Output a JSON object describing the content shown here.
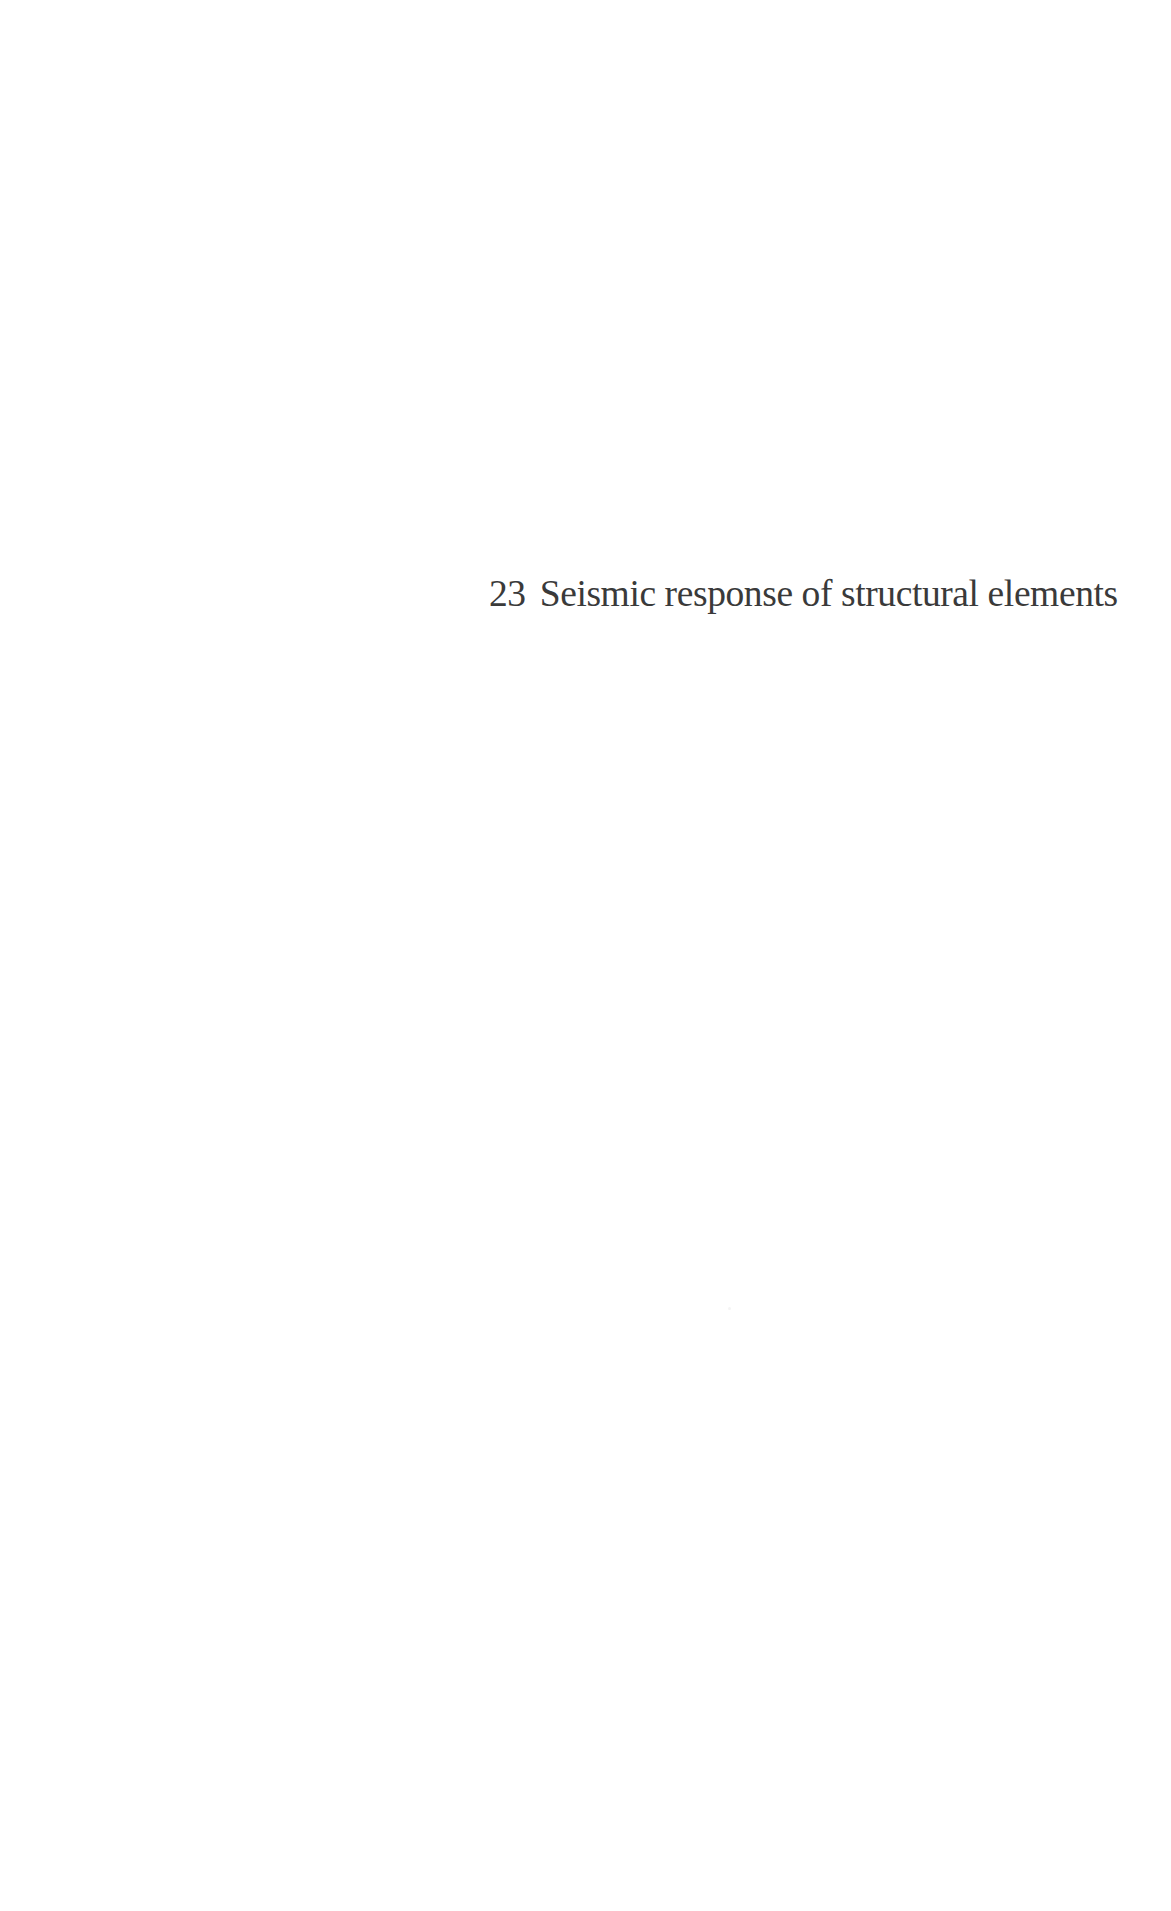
{
  "page": {
    "background_color": "#ffffff",
    "text_color": "#3a3a3a"
  },
  "chapter": {
    "number": "23",
    "title": "Seismic response of structural elements"
  }
}
